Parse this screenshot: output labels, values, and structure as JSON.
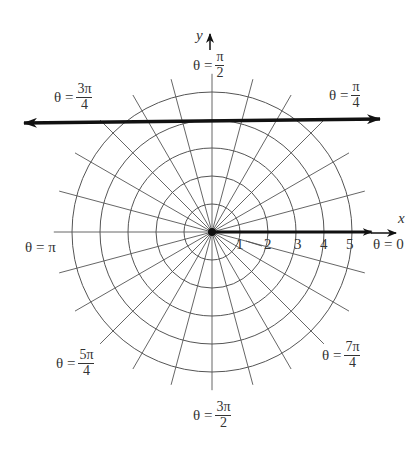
{
  "diagram": {
    "type": "polar-grid",
    "center_px": [
      212,
      232
    ],
    "unit_px": 28,
    "circles": [
      1,
      2,
      3,
      4,
      5
    ],
    "spoke_step_deg": 15,
    "spoke_extent": 5.65,
    "highlight_line": {
      "description": "horizontal line y = 4",
      "y": 4,
      "color": "#111111"
    },
    "ray": {
      "description": "bold ray along theta = 0",
      "color": "#111111"
    },
    "grid_color": "#555555"
  },
  "axes": {
    "x_label": "x",
    "y_label": "y"
  },
  "radial_ticks": [
    "1",
    "2",
    "3",
    "4",
    "5"
  ],
  "angle_labels": {
    "theta_symbol": "θ",
    "equals": "=",
    "pi_half": {
      "num": "π",
      "den": "2"
    },
    "three_pi_quarter": {
      "num": "3π",
      "den": "4"
    },
    "pi_quarter": {
      "num": "π",
      "den": "4"
    },
    "pi": "π",
    "zero": "0",
    "five_pi_quarter": {
      "num": "5π",
      "den": "4"
    },
    "seven_pi_quarter": {
      "num": "7π",
      "den": "4"
    },
    "three_pi_half": {
      "num": "3π",
      "den": "2"
    }
  }
}
